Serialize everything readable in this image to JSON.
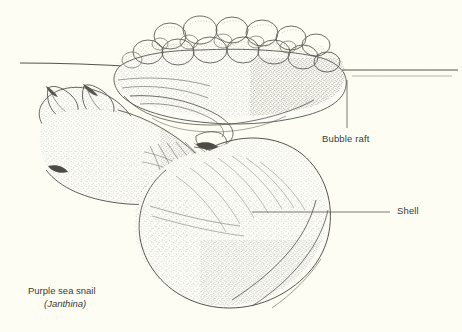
{
  "figure": {
    "style": "pen-and-ink stipple scientific illustration",
    "background_color": "#fdfdf4",
    "ink_color": "#55544e",
    "label_color": "#3b3b38"
  },
  "labels": [
    {
      "id": "bubble-raft",
      "text": "Bubble raft",
      "leader": "vertical line rising from label to the underside of the bubble mass"
    },
    {
      "id": "shell",
      "text": "Shell",
      "leader": "horizontal line running left from label to the shell body whorl"
    }
  ],
  "caption": {
    "common_name": "Purple sea snail",
    "scientific_name": "(Janthina)"
  },
  "waterline": {
    "description": "sea surface line crossing the full width of the plate"
  }
}
